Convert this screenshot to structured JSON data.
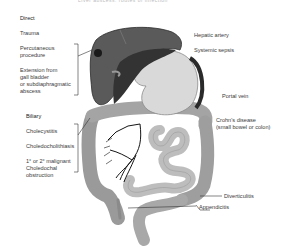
{
  "diagram": {
    "top_caption_cut": "Liver abscess: routes of infection",
    "groups": [
      {
        "header": "Direct",
        "items": [
          "Trauma",
          "Percutaneous procedure",
          "Extension from gall bladder or subdiaphragmatic abscess"
        ]
      },
      {
        "header": "Biliary",
        "items": [
          "Cholecystitis",
          "Choledocholithiasis",
          "1° or 2° malignant Choledochal obstruction"
        ]
      }
    ],
    "right_labels": {
      "hepatic_artery": "Hepatic artery",
      "systemic_sepsis": "Systemic sepsis",
      "portal_vein": "Portal vein",
      "crohns_line1": "Crohn's disease",
      "crohns_line2": "(small bowel or colon)",
      "diverticulitis": "Diverticulitis",
      "appendicitis": "Appendicitis"
    },
    "left_text": {
      "direct": "Direct",
      "trauma": "Trauma",
      "percut_1": "Percutaneous",
      "percut_2": "procedure",
      "ext_1": "Extension from",
      "ext_2": "gall bladder",
      "ext_3": "or subdiaphragmatic",
      "ext_4": "abscess",
      "biliary": "Biliary",
      "chole": "Cholecystitis",
      "choledo": "Choledocholithiasis",
      "malig_1": "1° or 2° malignant",
      "malig_2": "Choledochal",
      "malig_3": "obstruction"
    },
    "colors": {
      "liver": "#5e5e5e",
      "liver_dark": "#2e2e2e",
      "stomach": "#d6d6d6",
      "bowel": "#a9a9a9",
      "bowel_light": "#c4c4c4",
      "line": "#222222"
    }
  }
}
